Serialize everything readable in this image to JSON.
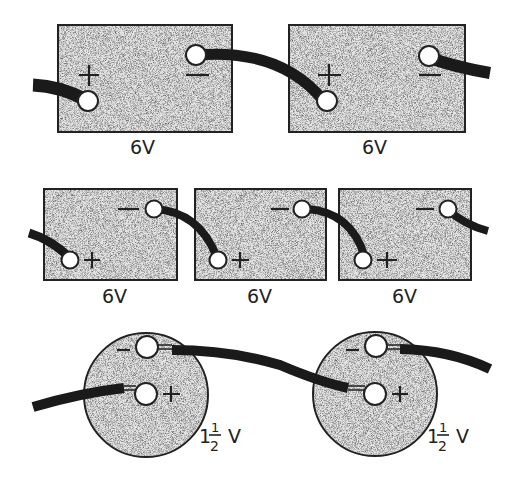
{
  "figure": {
    "rows": [
      {
        "name": "two-6v-batteries-in-series",
        "batteries": [
          {
            "label": "6V",
            "plus": "+",
            "minus": "−"
          },
          {
            "label": "6V",
            "plus": "+",
            "minus": "−"
          }
        ]
      },
      {
        "name": "three-6v-batteries-in-series",
        "batteries": [
          {
            "label": "6V",
            "plus": "+",
            "minus": "−"
          },
          {
            "label": "6V",
            "plus": "+",
            "minus": "−"
          },
          {
            "label": "6V",
            "plus": "+",
            "minus": "−"
          }
        ]
      },
      {
        "name": "two-1.5v-cells-in-series",
        "cells": [
          {
            "label_whole": "1",
            "label_num": "1",
            "label_den": "2",
            "label_unit": "V",
            "plus": "+",
            "minus": "−"
          },
          {
            "label_whole": "1",
            "label_num": "1",
            "label_den": "2",
            "label_unit": "V",
            "plus": "+",
            "minus": "−"
          }
        ]
      }
    ],
    "colors": {
      "background": "#ffffff",
      "battery_fill": "#e4e4e4",
      "outline": "#222222",
      "wire": "#1a1a1a"
    }
  }
}
